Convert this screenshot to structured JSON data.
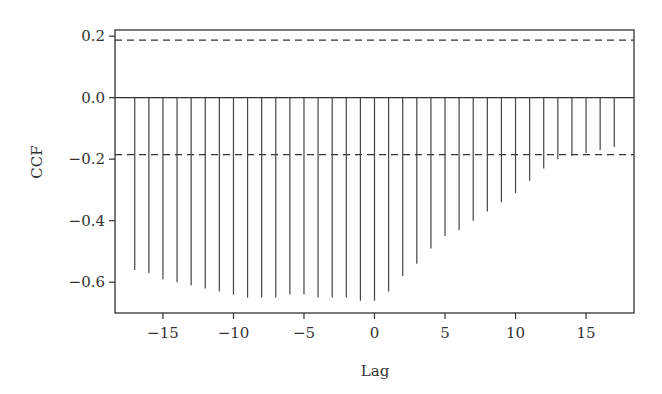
{
  "chart_data": {
    "type": "bar",
    "subtype": "ccf-lollipop",
    "title": "",
    "xlabel": "Lag",
    "ylabel": "CCF",
    "xlim": [
      -18.4,
      18.4
    ],
    "ylim": [
      -0.7,
      0.22
    ],
    "grid": false,
    "legend": null,
    "x_ticks": [
      -15,
      -10,
      -5,
      0,
      5,
      10,
      15
    ],
    "x_tick_labels": [
      "−15",
      "−10",
      "−5",
      "0",
      "5",
      "10",
      "15"
    ],
    "y_ticks": [
      0.2,
      0.0,
      -0.2,
      -0.4,
      -0.6
    ],
    "y_tick_labels": [
      "0.2",
      "0.0",
      "−0.2",
      "−0.4",
      "−0.6"
    ],
    "confidence_bounds": {
      "upper": 0.187,
      "lower": -0.185,
      "style": "dashed"
    },
    "zero_line": 0.0,
    "x": [
      -17,
      -16,
      -15,
      -14,
      -13,
      -12,
      -11,
      -10,
      -9,
      -8,
      -7,
      -6,
      -5,
      -4,
      -3,
      -2,
      -1,
      0,
      1,
      2,
      3,
      4,
      5,
      6,
      7,
      8,
      9,
      10,
      11,
      12,
      13,
      14,
      15,
      16,
      17
    ],
    "values": [
      -0.56,
      -0.57,
      -0.59,
      -0.6,
      -0.61,
      -0.62,
      -0.63,
      -0.64,
      -0.65,
      -0.65,
      -0.65,
      -0.64,
      -0.64,
      -0.65,
      -0.65,
      -0.65,
      -0.66,
      -0.66,
      -0.63,
      -0.58,
      -0.54,
      -0.49,
      -0.45,
      -0.43,
      -0.4,
      -0.37,
      -0.34,
      -0.31,
      -0.27,
      -0.23,
      -0.2,
      -0.19,
      -0.18,
      -0.17,
      -0.16
    ],
    "colors": {
      "bars": "#444444",
      "axes": "#333333",
      "dashed": "#333333",
      "text": "#333333"
    }
  }
}
